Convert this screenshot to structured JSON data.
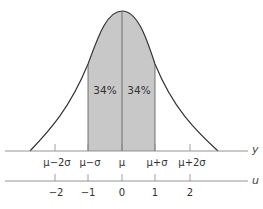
{
  "diagram": {
    "title": "",
    "type": "normal-distribution",
    "shaded_region": {
      "from": "μ−σ",
      "to": "μ+σ",
      "fill": "#c8c8c8"
    },
    "region_labels": [
      {
        "text": "34%",
        "side": "left"
      },
      {
        "text": "34%",
        "side": "right"
      }
    ],
    "y_axis": {
      "name": "y",
      "ticks": [
        "μ−2σ",
        "μ−σ",
        "μ",
        "μ+σ",
        "μ+2σ"
      ]
    },
    "u_axis": {
      "name": "u",
      "ticks": [
        "−2",
        "−1",
        "0",
        "1",
        "2"
      ]
    },
    "colors": {
      "curve": "#333333",
      "axis": "#888888",
      "shade": "#c8c8c8"
    }
  }
}
